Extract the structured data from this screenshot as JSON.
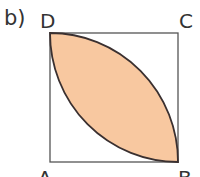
{
  "part_label": "b)",
  "vertices": {
    "top_left": "D",
    "top_right": "C",
    "bottom_left": "A",
    "bottom_right": "B"
  },
  "figure": {
    "shape": "square with two quarter-circle arcs forming a shaded lens between D and B",
    "fill_color": "#f8c8a0",
    "stroke_color": "#333333"
  }
}
